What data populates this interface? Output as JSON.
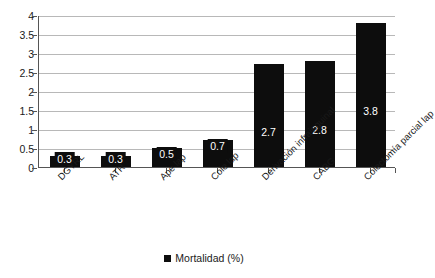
{
  "chart_data": {
    "type": "bar",
    "title": "",
    "subtitle": "",
    "xlabel": "",
    "ylabel": "",
    "ylim": [
      0,
      4
    ],
    "ytick_step": 0.5,
    "yticks": [
      "0",
      "0.5",
      "1",
      "1.5",
      "2",
      "2.5",
      "3",
      "3.5",
      "4"
    ],
    "grid": "horizontal",
    "legend_position": "bottom-center",
    "categories": [
      "DGYRL",
      "ATR",
      "Ape lap",
      "Cole lap",
      "Derivación infrainguinal",
      "CABG",
      "Colectomía parcial lap"
    ],
    "series": [
      {
        "name": "Mortalidad (%)",
        "values": [
          0.3,
          0.3,
          0.5,
          0.7,
          2.7,
          2.8,
          3.8
        ],
        "labels": [
          "0.3",
          "0.3",
          "0.5",
          "0.7",
          "2.7",
          "2.8",
          "3.8"
        ],
        "color": "#0d0d0d"
      }
    ]
  },
  "legend": {
    "marker": "black-square-marker",
    "label": "Mortalidad (%)"
  },
  "colors": {
    "bar": "#0d0d0d",
    "gridline": "#b8b8b8",
    "axis": "#555555",
    "text": "#1a1a1a",
    "value_label": "#ffffff",
    "background": "#ffffff"
  }
}
